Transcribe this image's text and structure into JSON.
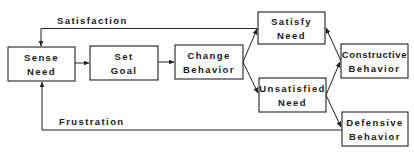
{
  "diagram": {
    "type": "flowchart",
    "colors": {
      "stroke": "#222222",
      "text": "#1a1a1a",
      "background": "#ffffff"
    },
    "nodes": {
      "sense_need": {
        "line1": "Sense",
        "line2": "Need"
      },
      "set_goal": {
        "line1": "Set",
        "line2": "Goal"
      },
      "change_behavior": {
        "line1": "Change",
        "line2": "Behavior"
      },
      "satisfy_need": {
        "line1": "Satisfy",
        "line2": "Need"
      },
      "unsatisfied_need": {
        "line1": "Unsatisfied",
        "line2": "Need"
      },
      "constructive_behavior": {
        "line1": "Constructive",
        "line2": "Behavior"
      },
      "defensive_behavior": {
        "line1": "Defensive",
        "line2": "Behavior"
      }
    },
    "edge_labels": {
      "satisfaction": "Satisfaction",
      "frustration": "Frustration"
    },
    "edges": [
      {
        "from": "Sense Need",
        "to": "Set Goal"
      },
      {
        "from": "Set Goal",
        "to": "Change Behavior"
      },
      {
        "from": "Change Behavior",
        "to": "Satisfy Need"
      },
      {
        "from": "Change Behavior",
        "to": "Unsatisfied Need"
      },
      {
        "from": "Unsatisfied Need",
        "to": "Constructive Behavior"
      },
      {
        "from": "Unsatisfied Need",
        "to": "Defensive Behavior"
      },
      {
        "from": "Constructive Behavior",
        "to": "Satisfy Need"
      },
      {
        "from": "Satisfy Need",
        "to": "Sense Need",
        "label": "Satisfaction"
      },
      {
        "from": "Defensive Behavior",
        "to": "Sense Need",
        "label": "Frustration"
      }
    ]
  }
}
